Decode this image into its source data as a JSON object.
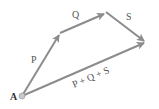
{
  "diagram": {
    "origin_label": "A",
    "colors": {
      "vector": "#8c8c8c",
      "point": "#b0b0b0",
      "text": "#555555"
    },
    "points": {
      "A": [
        22,
        96
      ],
      "P_end": [
        60,
        33
      ],
      "Q_end": [
        106,
        13
      ],
      "S_end": [
        146,
        42
      ]
    },
    "vectors": [
      {
        "name": "P",
        "label": "P",
        "from": "A",
        "to": "P_end"
      },
      {
        "name": "Q",
        "label": "Q",
        "from": "P_end",
        "to": "Q_end"
      },
      {
        "name": "S",
        "label": "S",
        "from": "Q_end",
        "to": "S_end"
      },
      {
        "name": "resultant",
        "label": "P + Q + S",
        "from": "A",
        "to": "S_end"
      }
    ]
  }
}
